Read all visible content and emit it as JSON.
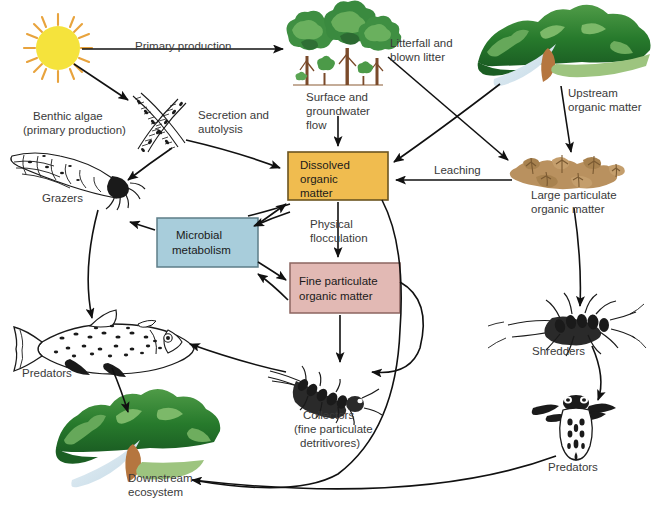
{
  "diagram": {
    "background_color": "#ffffff",
    "width": 664,
    "height": 511
  },
  "boxes": [
    {
      "id": "dissolved-organic-matter",
      "label": "Dissolved\norganic\nmatter",
      "line1": "Dissolved",
      "line2": "organic",
      "line3": "matter",
      "fill": "#F0BC4F",
      "stroke": "#6b5420"
    },
    {
      "id": "microbial-metabolism",
      "label": "Microbial\nmetabolism",
      "line1": "Microbial",
      "line2": "metabolism",
      "fill": "#A8CDDB",
      "stroke": "#5d7d88"
    },
    {
      "id": "fine-particulate-organic-matter",
      "label": "Fine particulate\norganic matter",
      "line1": "Fine particulate",
      "line2": "organic matter",
      "fill": "#E2B9B4",
      "stroke": "#8c6560"
    }
  ],
  "illustrations": [
    {
      "id": "sun",
      "label": "",
      "color": "#F5E33C",
      "ray_color": "#E8A33D"
    },
    {
      "id": "forest-trees",
      "label_line1": "Surface and",
      "label_line2": "groundwater",
      "label_line3": "flow",
      "color": "#3f7d3a"
    },
    {
      "id": "upstream-valley",
      "label_line1": "Upstream",
      "label_line2": "organic matter",
      "color": "#2f7a33"
    },
    {
      "id": "benthic-algae",
      "label_line1": "Benthic algae",
      "label_line2": "(primary production)",
      "color": "#1a1a1a"
    },
    {
      "id": "grazers",
      "label_line1": "Grazers",
      "color": "#1a1a1a"
    },
    {
      "id": "large-particulate-organic-matter",
      "label_line1": "Large particulate",
      "label_line2": "organic matter",
      "color": "#B08B5E"
    },
    {
      "id": "shredders",
      "label_line1": "Shredders",
      "color": "#1a1a1a"
    },
    {
      "id": "predators-fish",
      "label_line1": "Predators",
      "color": "#1a1a1a"
    },
    {
      "id": "collectors",
      "label_line1": "Collectors",
      "label_line2": "(fine particulate",
      "label_line3": "detritivores)",
      "color": "#1a1a1a"
    },
    {
      "id": "predators-insect",
      "label_line1": "Predators",
      "color": "#1a1a1a"
    },
    {
      "id": "downstream-ecosystem",
      "label_line1": "Downstream",
      "label_line2": "ecosystem",
      "color": "#1e6b2a"
    }
  ],
  "flow_labels": [
    {
      "id": "primary-production",
      "text": "Primary production"
    },
    {
      "id": "litterfall",
      "line1": "Litterfall and",
      "line2": "blown litter"
    },
    {
      "id": "secretion-autolysis",
      "line1": "Secretion and",
      "line2": "autolysis"
    },
    {
      "id": "leaching",
      "text": "Leaching"
    },
    {
      "id": "physical-flocculation",
      "line1": "Physical",
      "line2": "flocculation"
    }
  ],
  "text": {
    "primary_production": "Primary production",
    "litterfall_l1": "Litterfall and",
    "litterfall_l2": "blown litter",
    "upstream_l1": "Upstream",
    "upstream_l2": "organic matter",
    "surface_l1": "Surface and",
    "surface_l2": "groundwater",
    "surface_l3": "flow",
    "benthic_l1": "Benthic algae",
    "benthic_l2": "(primary production)",
    "secretion_l1": "Secretion and",
    "secretion_l2": "autolysis",
    "grazers": "Grazers",
    "dom_l1": "Dissolved",
    "dom_l2": "organic",
    "dom_l3": "matter",
    "leaching": "Leaching",
    "lpom_l1": "Large particulate",
    "lpom_l2": "organic matter",
    "microbial_l1": "Microbial",
    "microbial_l2": "metabolism",
    "flocculation_l1": "Physical",
    "flocculation_l2": "flocculation",
    "fpom_l1": "Fine particulate",
    "fpom_l2": "organic matter",
    "shredders": "Shredders",
    "predators_fish": "Predators",
    "collectors_l1": "Collectors",
    "collectors_l2": "(fine particulate",
    "collectors_l3": "detritivores)",
    "predators_insect": "Predators",
    "downstream_l1": "Downstream",
    "downstream_l2": "ecosystem"
  }
}
